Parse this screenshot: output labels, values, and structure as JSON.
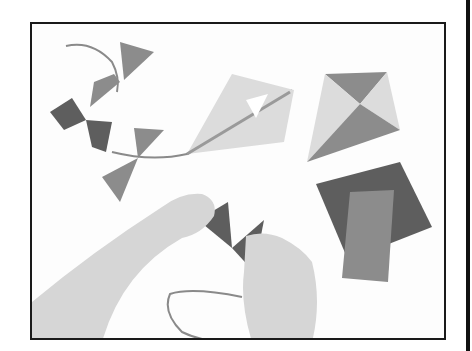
{
  "image": {
    "description": "Grayscale craft illustration: hands tying fabric bow-tie tail pieces onto a string beside paper kites",
    "palette": {
      "background": "#ffffff",
      "frame": "#1a1a1a",
      "kite_light": "#dcdcdc",
      "kite_mid": "#9a9a9a",
      "kite_dark": "#7a7a7a",
      "fabric_dark": "#5e5e5e",
      "fabric_mid": "#8c8c8c",
      "skin": "#d6d6d6",
      "string": "#8a8a8a"
    },
    "objects": [
      {
        "name": "tail-bows",
        "count": 4
      },
      {
        "name": "kite-with-spar"
      },
      {
        "name": "cross-kite"
      },
      {
        "name": "fabric-squares",
        "count": 2
      },
      {
        "name": "hands",
        "count": 2
      },
      {
        "name": "string-loop"
      }
    ]
  }
}
